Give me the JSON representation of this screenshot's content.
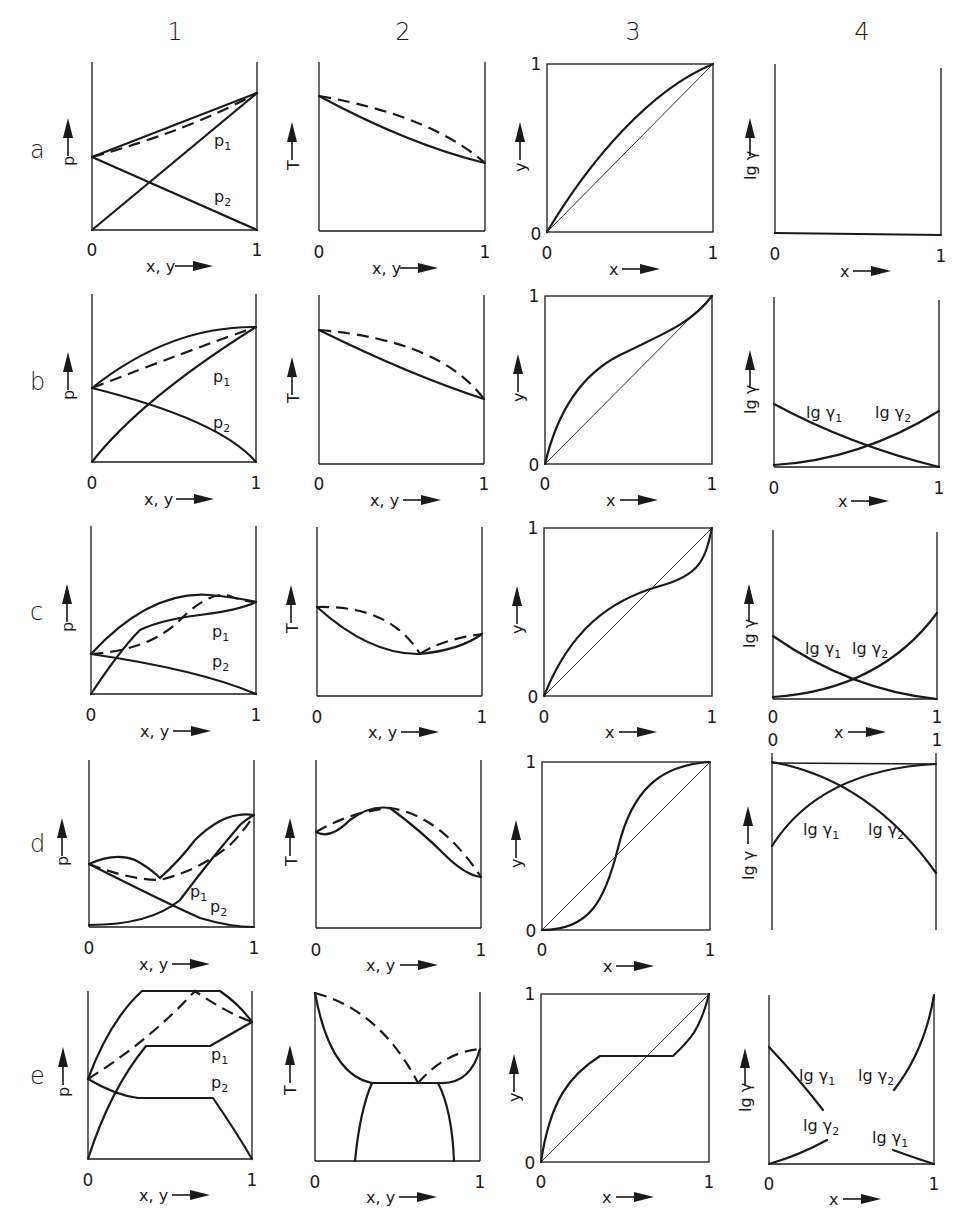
{
  "figure": {
    "columns": [
      {
        "id": "1",
        "label": "1",
        "x_axis": "x, y",
        "y_axis": "p"
      },
      {
        "id": "2",
        "label": "2",
        "x_axis": "x, y",
        "y_axis": "T"
      },
      {
        "id": "3",
        "label": "3",
        "x_axis": "x",
        "y_axis": "y"
      },
      {
        "id": "4",
        "label": "4",
        "x_axis": "x",
        "y_axis": "lg γ"
      }
    ],
    "rows": [
      {
        "id": "a",
        "label": "a"
      },
      {
        "id": "b",
        "label": "b"
      },
      {
        "id": "c",
        "label": "c"
      },
      {
        "id": "d",
        "label": "d"
      },
      {
        "id": "e",
        "label": "e"
      }
    ],
    "ticks": {
      "zero": "0",
      "one": "1"
    },
    "curve_labels": {
      "p1": "p",
      "p1_sub": "1",
      "p2": "p",
      "p2_sub": "2",
      "lg_gamma1": "lg γ",
      "lg_gamma1_sub": "1",
      "lg_gamma2": "lg γ",
      "lg_gamma2_sub": "2"
    },
    "axis_labels": {
      "p": "p",
      "T": "T",
      "y": "y",
      "lg_gamma": "lg γ",
      "xy": "x, y",
      "x": "x"
    },
    "legend": {
      "solid": "boiling / partial pressure curves",
      "dashed": "dew (vapour) curve",
      "thin_diagonal": "y = x reference line"
    }
  }
}
